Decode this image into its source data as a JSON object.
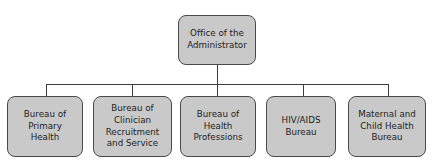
{
  "chart_data": {
    "type": "diagram",
    "diagram_kind": "organizational-chart",
    "title": "",
    "orientation": "top-down",
    "levels": 2,
    "root": {
      "id": "office-of-the-administrator",
      "label": "Office of the\nAdministrator"
    },
    "children": [
      {
        "id": "bureau-of-primary-health",
        "label": "Bureau of\nPrimary\nHealth"
      },
      {
        "id": "bureau-of-clinician-recruitment-and-service",
        "label": "Bureau of\nClinician\nRecruitment\nand Service"
      },
      {
        "id": "bureau-of-health-professions",
        "label": "Bureau of\nHealth\nProfessions"
      },
      {
        "id": "hiv-aids-bureau",
        "label": "HIV/AIDS\nBureau"
      },
      {
        "id": "maternal-and-child-health-bureau",
        "label": "Maternal and\nChild Health\nBureau"
      }
    ],
    "edges": [
      {
        "from": "office-of-the-administrator",
        "to": "bureau-of-primary-health"
      },
      {
        "from": "office-of-the-administrator",
        "to": "bureau-of-clinician-recruitment-and-service"
      },
      {
        "from": "office-of-the-administrator",
        "to": "bureau-of-health-professions"
      },
      {
        "from": "office-of-the-administrator",
        "to": "hiv-aids-bureau"
      },
      {
        "from": "office-of-the-administrator",
        "to": "maternal-and-child-health-bureau"
      }
    ],
    "colors": {
      "background": "#ffffff",
      "node_fill": "#c9c9c9",
      "node_border": "#4a4a4a",
      "connector": "#3d3d3d",
      "text": "#1c1c1c"
    }
  }
}
